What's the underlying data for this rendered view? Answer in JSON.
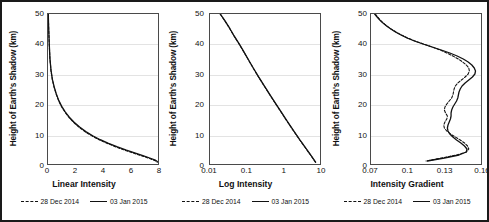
{
  "figure": {
    "panel_count": 3,
    "background": "#ffffff",
    "border_color": "#1a1a1a"
  },
  "legend": {
    "series": [
      {
        "label": "28 Dec 2014",
        "style": "dashed"
      },
      {
        "label": "03 Jan 2015",
        "style": "solid"
      }
    ]
  },
  "chart_data": [
    {
      "type": "line",
      "title": "",
      "xlabel": "Linear Intensity",
      "ylabel": "Height of Earth's Shadow (km)",
      "xscale": "linear",
      "yscale": "linear",
      "xlim": [
        0,
        8
      ],
      "ylim": [
        0,
        50
      ],
      "xticks": [
        0,
        2,
        4,
        6,
        8
      ],
      "yticks": [
        0,
        10,
        20,
        30,
        40,
        50
      ],
      "grid": "horizontal",
      "legend_position": "below",
      "series": [
        {
          "name": "28 Dec 2014",
          "style": "dashed",
          "x": [
            0.02,
            0.05,
            0.09,
            0.14,
            0.22,
            0.32,
            0.45,
            0.6,
            0.78,
            1.0,
            1.25,
            1.55,
            1.9,
            2.3,
            2.75,
            3.25,
            3.8,
            4.4,
            5.05,
            5.7,
            6.3,
            6.9,
            7.4,
            7.8,
            7.95
          ],
          "y": [
            50,
            45,
            40,
            35,
            31,
            28,
            25.5,
            23.2,
            21,
            19,
            17.2,
            15.4,
            13.7,
            12.1,
            10.6,
            9.2,
            7.9,
            6.7,
            5.5,
            4.4,
            3.5,
            2.6,
            1.8,
            1.1,
            0.6
          ]
        },
        {
          "name": "03 Jan 2015",
          "style": "solid",
          "x": [
            0.02,
            0.05,
            0.09,
            0.14,
            0.22,
            0.32,
            0.45,
            0.6,
            0.78,
            1.0,
            1.25,
            1.55,
            1.9,
            2.3,
            2.75,
            3.25,
            3.8,
            4.4,
            5.05,
            5.7,
            6.3,
            6.9,
            7.4,
            7.8,
            7.95
          ],
          "y": [
            50,
            45.2,
            40.2,
            35.2,
            31.2,
            28.2,
            25.7,
            23.4,
            21.2,
            19.2,
            17.4,
            15.6,
            13.9,
            12.3,
            10.8,
            9.4,
            8.1,
            6.9,
            5.7,
            4.6,
            3.7,
            2.8,
            2.0,
            1.3,
            0.8
          ]
        }
      ]
    },
    {
      "type": "line",
      "title": "",
      "xlabel": "Log Intensity",
      "ylabel": "Height of Earth's Shadow (km)",
      "xscale": "log",
      "yscale": "linear",
      "xlim": [
        0.01,
        10
      ],
      "ylim": [
        0,
        50
      ],
      "xticks": [
        0.01,
        0.1,
        1,
        10
      ],
      "xticklabels": [
        "0.01",
        "0.1",
        "1",
        "10"
      ],
      "yticks": [
        0,
        10,
        20,
        30,
        40,
        50
      ],
      "grid": "horizontal",
      "legend_position": "below",
      "series": [
        {
          "name": "28 Dec 2014",
          "style": "dashed",
          "x": [
            0.019,
            0.026,
            0.035,
            0.046,
            0.062,
            0.082,
            0.108,
            0.15,
            0.21,
            0.3,
            0.43,
            0.62,
            0.9,
            1.3,
            1.9,
            2.8,
            4.1,
            5.8,
            7.6
          ],
          "y": [
            50,
            47.5,
            45,
            42.5,
            40,
            37.5,
            35,
            32,
            29,
            26,
            23,
            20,
            17,
            14,
            11,
            8,
            5.2,
            2.6,
            0.5
          ]
        },
        {
          "name": "03 Jan 2015",
          "style": "solid",
          "x": [
            0.019,
            0.026,
            0.035,
            0.046,
            0.062,
            0.082,
            0.108,
            0.15,
            0.21,
            0.3,
            0.43,
            0.62,
            0.9,
            1.3,
            1.9,
            2.8,
            4.1,
            5.8,
            7.6
          ],
          "y": [
            50,
            47.6,
            45.1,
            42.6,
            40.1,
            37.6,
            35.1,
            32.1,
            29.1,
            26.1,
            23.1,
            20.1,
            17.1,
            14.1,
            11.1,
            8.1,
            5.3,
            2.7,
            0.6
          ]
        }
      ]
    },
    {
      "type": "line",
      "title": "",
      "xlabel": "Intensity Gradient",
      "ylabel": "Height of Earth's Shadow (km)",
      "xscale": "linear",
      "yscale": "linear",
      "xlim": [
        0.07,
        0.16
      ],
      "ylim": [
        0,
        50
      ],
      "xticks": [
        0.07,
        0.1,
        0.13,
        0.16
      ],
      "xticklabels": [
        "0.07",
        "0.1",
        "0.13",
        "0.16"
      ],
      "yticks": [
        0,
        10,
        20,
        30,
        40,
        50
      ],
      "grid": "horizontal",
      "legend_position": "below",
      "series": [
        {
          "name": "28 Dec 2014",
          "style": "dashed",
          "x": [
            0.0735,
            0.0755,
            0.0775,
            0.08,
            0.083,
            0.0865,
            0.0905,
            0.095,
            0.1,
            0.106,
            0.113,
            0.12,
            0.1265,
            0.132,
            0.137,
            0.1415,
            0.145,
            0.148,
            0.15,
            0.1505,
            0.1495,
            0.147,
            0.144,
            0.141,
            0.139,
            0.138,
            0.1375,
            0.137,
            0.136,
            0.134,
            0.132,
            0.1305,
            0.13,
            0.131,
            0.1325,
            0.132,
            0.1305,
            0.1295,
            0.13,
            0.132,
            0.135,
            0.139,
            0.143,
            0.1465,
            0.149,
            0.15,
            0.148,
            0.14,
            0.128,
            0.115
          ],
          "y": [
            50,
            49,
            48,
            47,
            46,
            45,
            44,
            43,
            42,
            41,
            40,
            39,
            38,
            37,
            36,
            35,
            34,
            33,
            32,
            31,
            30,
            29,
            28,
            27,
            26,
            25,
            24,
            23,
            22,
            21,
            20,
            19,
            18,
            17,
            16,
            15,
            14,
            13,
            12,
            11,
            10,
            9,
            8,
            7,
            6,
            5,
            4,
            3,
            2,
            1
          ]
        },
        {
          "name": "03 Jan 2015",
          "style": "solid",
          "x": [
            0.073,
            0.075,
            0.0772,
            0.0798,
            0.0828,
            0.0862,
            0.09,
            0.0945,
            0.0995,
            0.1055,
            0.1125,
            0.12,
            0.1275,
            0.1345,
            0.1405,
            0.1455,
            0.1495,
            0.1525,
            0.1545,
            0.1555,
            0.155,
            0.153,
            0.15,
            0.147,
            0.1445,
            0.143,
            0.142,
            0.1415,
            0.141,
            0.14,
            0.1385,
            0.137,
            0.136,
            0.1355,
            0.1355,
            0.135,
            0.134,
            0.133,
            0.1325,
            0.133,
            0.1345,
            0.137,
            0.14,
            0.1435,
            0.1465,
            0.1485,
            0.148,
            0.142,
            0.13,
            0.116
          ],
          "y": [
            50,
            49,
            48,
            47,
            46,
            45,
            44,
            43,
            42,
            41,
            40,
            39,
            38,
            37,
            36,
            35,
            34,
            33,
            32,
            31,
            30,
            29,
            28,
            27,
            26,
            25,
            24,
            23,
            22,
            21,
            20,
            19,
            18,
            17,
            16,
            15,
            14,
            13,
            12,
            11,
            10,
            9,
            8,
            7,
            6,
            5,
            4,
            3,
            2,
            1
          ]
        }
      ]
    }
  ]
}
